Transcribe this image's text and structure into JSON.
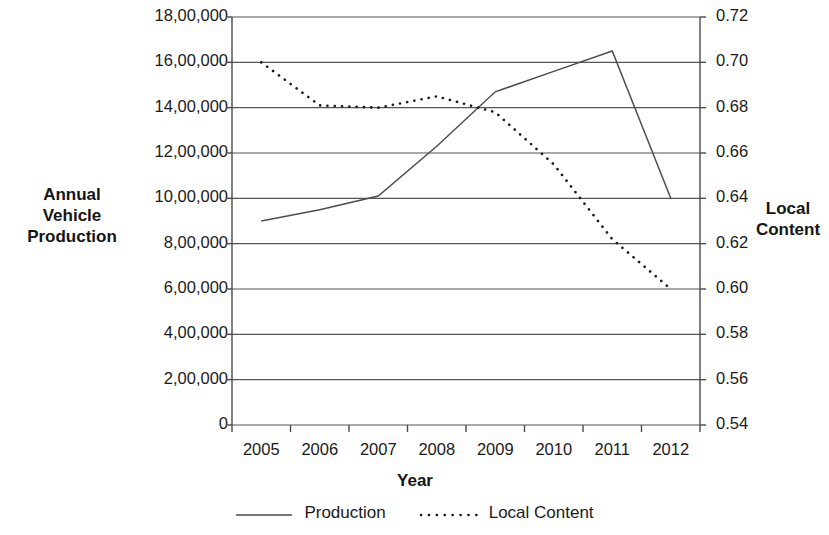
{
  "chart_data": {
    "type": "line",
    "title": "",
    "xlabel": "Year",
    "ylabel": "Annual Vehicle Production",
    "y2label": "Local Content",
    "categories": [
      "2005",
      "2006",
      "2007",
      "2008",
      "2009",
      "2010",
      "2011",
      "2012"
    ],
    "grid": true,
    "legend_position": "bottom",
    "axes": {
      "left": {
        "label": "Annual\nVehicle\nProduction",
        "ylim": [
          0,
          1800000
        ],
        "tick_step": 200000,
        "tick_labels": [
          "18,00,000",
          "16,00,000",
          "14,00,000",
          "12,00,000",
          "10,00,000",
          "8,00,000",
          "6,00,000",
          "4,00,000",
          "2,00,000",
          "0"
        ],
        "tick_values": [
          1800000,
          1600000,
          1400000,
          1200000,
          1000000,
          800000,
          600000,
          400000,
          200000,
          0
        ]
      },
      "right": {
        "label": "Local\nContent",
        "ylim": [
          0.54,
          0.72
        ],
        "tick_step": 0.02,
        "tick_labels": [
          "0.72",
          "0.70",
          "0.68",
          "0.66",
          "0.64",
          "0.62",
          "0.60",
          "0.58",
          "0.56",
          "0.54"
        ],
        "tick_values": [
          0.72,
          0.7,
          0.68,
          0.66,
          0.64,
          0.62,
          0.6,
          0.58,
          0.56,
          0.54
        ]
      },
      "x": {
        "label": "Year",
        "tick_labels": [
          "2005",
          "2006",
          "2007",
          "2008",
          "2009",
          "2010",
          "2011",
          "2012"
        ]
      }
    },
    "series": [
      {
        "name": "Production",
        "axis": "left",
        "style": "solid",
        "color": "#4d4d4d",
        "values": [
          900000,
          950000,
          1010000,
          1230000,
          1470000,
          1560000,
          1650000,
          1000000
        ]
      },
      {
        "name": "Local Content",
        "axis": "right",
        "style": "dotted",
        "color": "#1a1a1a",
        "values": [
          0.7,
          0.681,
          0.68,
          0.685,
          0.678,
          0.655,
          0.622,
          0.6
        ]
      }
    ]
  },
  "legend": {
    "entries": [
      {
        "label": "Production",
        "style": "solid",
        "icon": "solid-line-icon"
      },
      {
        "label": "Local Content",
        "style": "dotted",
        "icon": "dotted-line-icon"
      }
    ]
  },
  "colors": {
    "line": "#4d4d4d",
    "dotted": "#1a1a1a",
    "axis": "#4a4a4a",
    "grid": "#555555",
    "text": "#1a1a1a",
    "background": "#ffffff"
  }
}
